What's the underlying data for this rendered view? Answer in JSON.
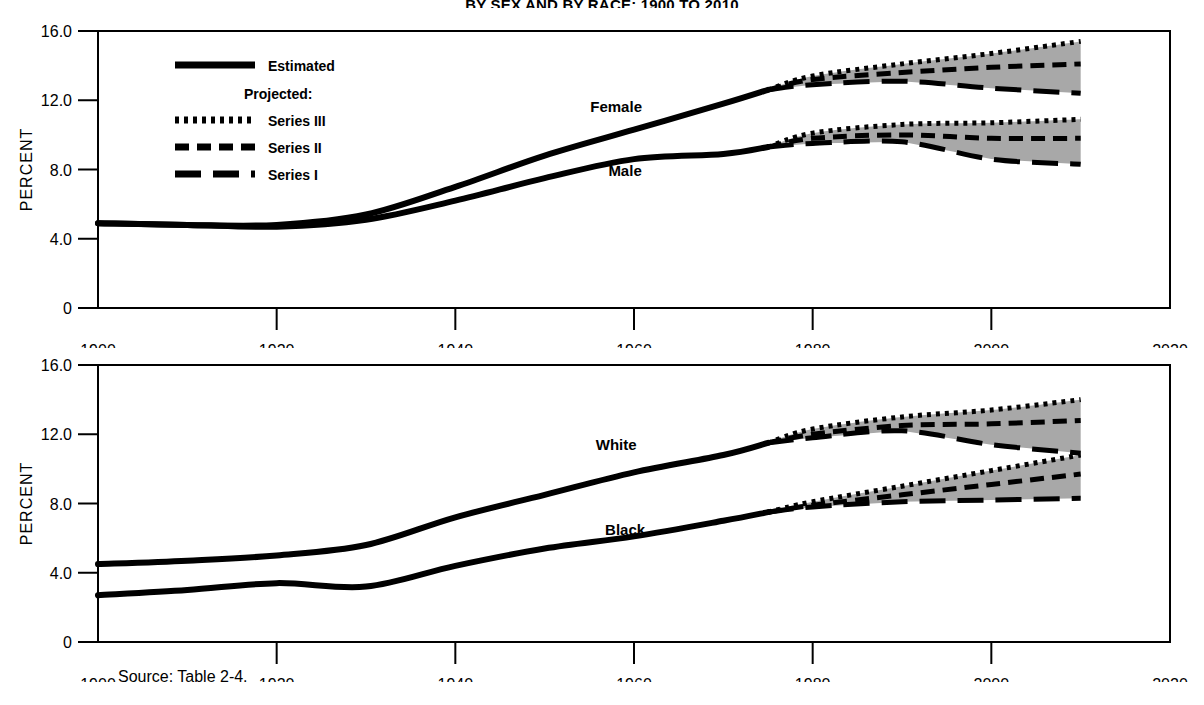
{
  "figure": {
    "title": "BY SEX AND BY RACE: 1900 TO 2010",
    "source_note": "Source:  Table 2-4.",
    "axis_x_label": "YEAR",
    "axis_y_label": "PERCENT",
    "ink_color": "#000000",
    "band_color": "#a8a8a8",
    "background": "#ffffff"
  },
  "legend": {
    "estimated_label": "Estimated",
    "projected_header": "Projected:",
    "items": [
      {
        "label": "Series III",
        "style": "dotted"
      },
      {
        "label": "Series II",
        "style": "dashed-short"
      },
      {
        "label": "Series I",
        "style": "dashed-long"
      }
    ]
  },
  "chart_data": [
    {
      "id": "panel-sex",
      "type": "line",
      "title": "",
      "xlabel": "YEAR",
      "ylabel": "PERCENT",
      "xlim": [
        1900,
        2020
      ],
      "ylim": [
        0,
        16
      ],
      "xticks": [
        1900,
        1920,
        1940,
        1960,
        1980,
        2000,
        2020
      ],
      "yticks": [
        0,
        4.0,
        8.0,
        12.0,
        16.0
      ],
      "yticklabels": [
        "0",
        "4.0",
        "8.0",
        "12.0",
        "16.0"
      ],
      "grid": false,
      "legend_position": "upper-left-inside",
      "annotations": [
        {
          "text": "Female",
          "x": 1958,
          "y": 11.3
        },
        {
          "text": "Male",
          "x": 1959,
          "y": 7.6
        }
      ],
      "series": [
        {
          "name": "Female",
          "kind": "estimated",
          "x": [
            1900,
            1910,
            1920,
            1930,
            1940,
            1950,
            1960,
            1970,
            1975
          ],
          "values": [
            4.9,
            4.8,
            4.8,
            5.4,
            7.0,
            8.8,
            10.3,
            11.8,
            12.6
          ]
        },
        {
          "name": "Male",
          "kind": "estimated",
          "x": [
            1900,
            1910,
            1920,
            1930,
            1940,
            1950,
            1960,
            1970,
            1975
          ],
          "values": [
            4.9,
            4.8,
            4.7,
            5.1,
            6.2,
            7.5,
            8.6,
            8.9,
            9.3
          ]
        },
        {
          "name": "Female Series III",
          "kind": "projected",
          "style": "dotted",
          "x": [
            1975,
            1980,
            1990,
            2000,
            2010
          ],
          "values": [
            12.6,
            13.4,
            14.1,
            14.7,
            15.4
          ]
        },
        {
          "name": "Female Series II",
          "kind": "projected",
          "style": "dashed-short",
          "x": [
            1975,
            1980,
            1990,
            2000,
            2010
          ],
          "values": [
            12.6,
            13.2,
            13.6,
            13.9,
            14.1
          ]
        },
        {
          "name": "Female Series I",
          "kind": "projected",
          "style": "dashed-long",
          "x": [
            1975,
            1980,
            1990,
            2000,
            2010
          ],
          "values": [
            12.6,
            12.9,
            13.1,
            12.7,
            12.4
          ]
        },
        {
          "name": "Male Series III",
          "kind": "projected",
          "style": "dotted",
          "x": [
            1975,
            1980,
            1990,
            2000,
            2010
          ],
          "values": [
            9.3,
            10.1,
            10.6,
            10.7,
            10.9
          ]
        },
        {
          "name": "Male Series II",
          "kind": "projected",
          "style": "dashed-short",
          "x": [
            1975,
            1980,
            1990,
            2000,
            2010
          ],
          "values": [
            9.3,
            9.8,
            10.0,
            9.8,
            9.8
          ]
        },
        {
          "name": "Male Series I",
          "kind": "projected",
          "style": "dashed-long",
          "x": [
            1975,
            1980,
            1990,
            2000,
            2010
          ],
          "values": [
            9.3,
            9.5,
            9.6,
            8.6,
            8.3
          ]
        }
      ]
    },
    {
      "id": "panel-race",
      "type": "line",
      "title": "",
      "xlabel": "YEAR",
      "ylabel": "PERCENT",
      "xlim": [
        1900,
        2020
      ],
      "ylim": [
        0,
        16
      ],
      "xticks": [
        1900,
        1920,
        1940,
        1960,
        1980,
        2000,
        2020
      ],
      "yticks": [
        0,
        4.0,
        8.0,
        12.0,
        16.0
      ],
      "yticklabels": [
        "0",
        "4.0",
        "8.0",
        "12.0",
        "16.0"
      ],
      "grid": false,
      "legend_position": "none",
      "annotations": [
        {
          "text": "White",
          "x": 1958,
          "y": 11.1
        },
        {
          "text": "Black",
          "x": 1959,
          "y": 6.2
        }
      ],
      "series": [
        {
          "name": "White",
          "kind": "estimated",
          "x": [
            1900,
            1910,
            1920,
            1930,
            1940,
            1950,
            1960,
            1970,
            1975
          ],
          "values": [
            4.5,
            4.7,
            5.0,
            5.6,
            7.2,
            8.5,
            9.8,
            10.8,
            11.5
          ]
        },
        {
          "name": "Black",
          "kind": "estimated",
          "x": [
            1900,
            1910,
            1920,
            1930,
            1940,
            1950,
            1960,
            1970,
            1975
          ],
          "values": [
            2.7,
            3.0,
            3.4,
            3.2,
            4.4,
            5.4,
            6.1,
            7.0,
            7.5
          ]
        },
        {
          "name": "White Series III",
          "kind": "projected",
          "style": "dotted",
          "x": [
            1975,
            1980,
            1990,
            2000,
            2010
          ],
          "values": [
            11.5,
            12.3,
            13.0,
            13.4,
            14.0
          ]
        },
        {
          "name": "White Series II",
          "kind": "projected",
          "style": "dashed-short",
          "x": [
            1975,
            1980,
            1990,
            2000,
            2010
          ],
          "values": [
            11.5,
            12.0,
            12.5,
            12.6,
            12.8
          ]
        },
        {
          "name": "White Series I",
          "kind": "projected",
          "style": "dashed-long",
          "x": [
            1975,
            1980,
            1990,
            2000,
            2010
          ],
          "values": [
            11.5,
            11.8,
            12.2,
            11.4,
            10.9
          ]
        },
        {
          "name": "Black Series III",
          "kind": "projected",
          "style": "dotted",
          "x": [
            1975,
            1980,
            1990,
            2000,
            2010
          ],
          "values": [
            7.5,
            8.1,
            9.0,
            9.9,
            10.8
          ]
        },
        {
          "name": "Black Series II",
          "kind": "projected",
          "style": "dashed-short",
          "x": [
            1975,
            1980,
            1990,
            2000,
            2010
          ],
          "values": [
            7.5,
            7.9,
            8.5,
            9.1,
            9.7
          ]
        },
        {
          "name": "Black Series I",
          "kind": "projected",
          "style": "dashed-long",
          "x": [
            1975,
            1980,
            1990,
            2000,
            2010
          ],
          "values": [
            7.5,
            7.8,
            8.1,
            8.2,
            8.3
          ]
        }
      ]
    }
  ]
}
